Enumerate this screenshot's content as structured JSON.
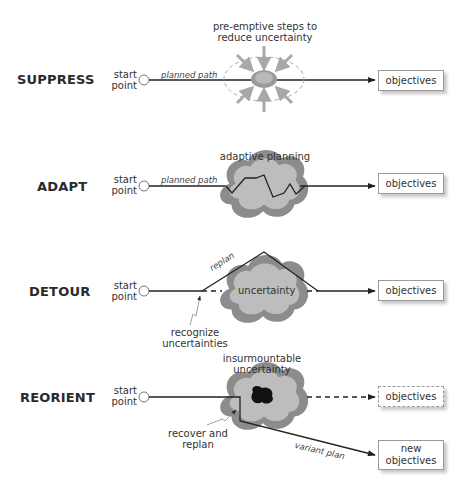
{
  "rows": [
    {
      "label": "SUPPRESS",
      "start": "start\npoint",
      "path_label": "planned path",
      "note": "pre-emptive steps to reduce uncertainty",
      "objective": "objectives"
    },
    {
      "label": "ADAPT",
      "start": "start\npoint",
      "path_label": "planned path",
      "note": "adaptive planning",
      "objective": "objectives"
    },
    {
      "label": "DETOUR",
      "start": "start\npoint",
      "path_label": "replan",
      "cloud_label": "uncertainty",
      "note": "recognize uncertainties",
      "objective": "objectives"
    },
    {
      "label": "REORIENT",
      "start": "start\npoint",
      "note": "insurmountable uncertainty",
      "note2": "recover and replan",
      "path_label": "variant plan",
      "objective": "objectives",
      "new_objective": "new objectives"
    }
  ],
  "colors": {
    "cloud_outer": "#8c8c8c",
    "cloud_inner": "#bdbdbd",
    "arrow_gray": "#a8a8a8",
    "line": "#222222",
    "core": "#111111"
  }
}
